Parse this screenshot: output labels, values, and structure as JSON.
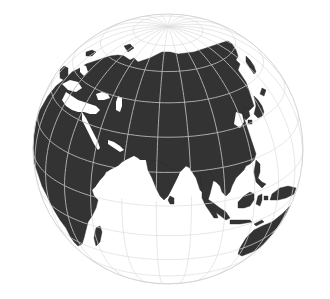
{
  "map": {
    "projection": "orthographic",
    "view_center": {
      "lon": 80,
      "lat": 25
    },
    "globe": {
      "cx": 168,
      "cy": 149,
      "r": 135
    },
    "graticule_step_deg": 15,
    "colors": {
      "background": "#ffffff",
      "ocean": "#ffffff",
      "land": "#333333",
      "graticule_over_land": "#b9b9b9",
      "graticule_over_sea": "#dcdcdc",
      "outline": "#d4d4d4"
    }
  }
}
